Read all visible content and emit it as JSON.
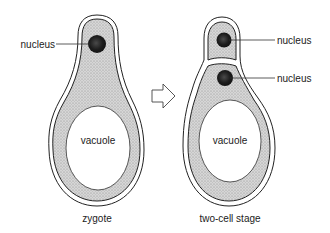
{
  "diagram": {
    "title": "",
    "panels": [
      {
        "id": "zygote",
        "caption": "zygote",
        "labels": {
          "nucleus": "nucleus",
          "vacuole": "vacuole"
        }
      },
      {
        "id": "two-cell",
        "caption": "two-cell stage",
        "labels": {
          "nucleus_top": "nucleus",
          "nucleus_bottom": "nucleus",
          "vacuole": "vacuole"
        }
      }
    ],
    "arrow": "arrow-right-icon",
    "colors": {
      "outline": "#222222",
      "cytoplasm": "#cfcfcf",
      "nucleus": "#1e1e1e",
      "vacuole": "#ffffff",
      "background": "#ffffff"
    }
  }
}
